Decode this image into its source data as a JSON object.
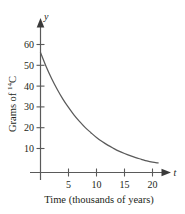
{
  "figure": {
    "background_color": "#ffffff",
    "ink_color": "#5a5a5a",
    "text_color": "#231f20"
  },
  "axis_names": {
    "vertical": "y",
    "horizontal": "t"
  },
  "labels": {
    "y_title_prefix": "Grams of ",
    "y_title_superscript": "14",
    "y_title_element": "C",
    "x_title": "Time (thousands of years)"
  },
  "chart_data": {
    "type": "line",
    "title": "",
    "xlabel": "Time (thousands of years)",
    "ylabel": "Grams of 14C",
    "xlim": [
      0,
      23
    ],
    "ylim": [
      0,
      66
    ],
    "grid": false,
    "legend": false,
    "x_ticks": [
      5,
      10,
      15,
      20
    ],
    "x_tick_labels": [
      "5",
      "10",
      "15",
      "20"
    ],
    "y_ticks": [
      10,
      20,
      30,
      40,
      50,
      60
    ],
    "y_tick_labels": [
      "10",
      "20",
      "30",
      "40",
      "50",
      "60"
    ],
    "series": [
      {
        "name": "Carbon-14 decay",
        "x": [
          0,
          1,
          2,
          3,
          4,
          5,
          6,
          7,
          8,
          9,
          10,
          11,
          12,
          13,
          14,
          15,
          16,
          17,
          18,
          19,
          20,
          21
        ],
        "y": [
          50.0,
          44.2,
          39.1,
          34.6,
          30.6,
          27.1,
          23.9,
          21.2,
          18.7,
          16.6,
          14.6,
          12.9,
          11.4,
          10.1,
          8.9,
          7.9,
          7.0,
          6.2,
          5.5,
          4.8,
          4.3,
          4.0
        ]
      }
    ],
    "annotations": []
  }
}
